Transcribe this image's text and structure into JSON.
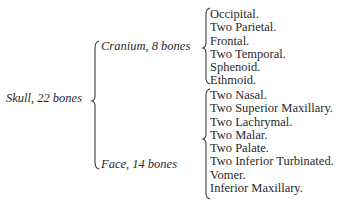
{
  "root": {
    "label": "Skull, 22 bones"
  },
  "groups": [
    {
      "label": "Cranium, 8 bones",
      "items": [
        "Occipital.",
        "Two Parietal.",
        "Frontal.",
        "Two Temporal.",
        "Sphenoid.",
        "Ethmoid."
      ]
    },
    {
      "label": "Face, 14 bones",
      "items": [
        "Two Nasal.",
        "Two Superior Maxillary.",
        "Two Lachrymal.",
        "Two Malar.",
        "Two Palate.",
        "Two Inferior Turbinated.",
        "Vomer.",
        "Inferior Maxillary."
      ]
    }
  ]
}
